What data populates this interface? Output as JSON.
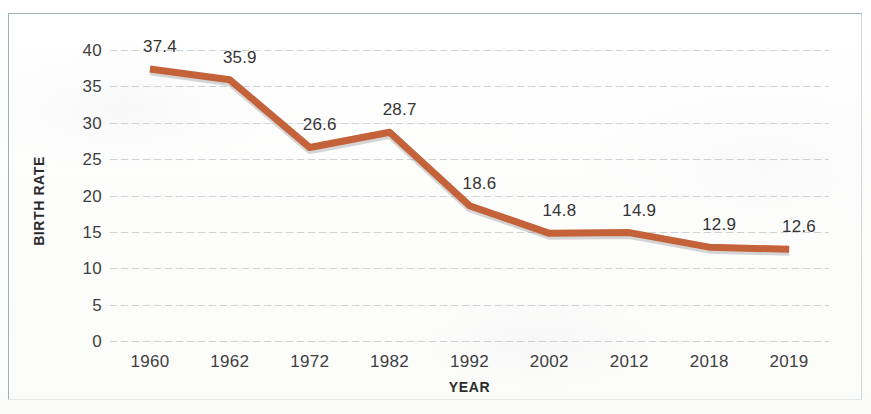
{
  "chart_data": {
    "type": "line",
    "title": "",
    "xlabel": "YEAR",
    "ylabel": "BIRTH RATE",
    "categories": [
      "1960",
      "1962",
      "1972",
      "1982",
      "1992",
      "2002",
      "2012",
      "2018",
      "2019"
    ],
    "values": [
      37.4,
      35.9,
      26.6,
      28.7,
      18.6,
      14.8,
      14.9,
      12.9,
      12.6
    ],
    "point_labels": [
      "37.4",
      "35.9",
      "26.6",
      "28.7",
      "18.6",
      "14.8",
      "14.9",
      "12.9",
      "12.6"
    ],
    "series": [
      {
        "name": "Birth Rate",
        "values": [
          37.4,
          35.9,
          26.6,
          28.7,
          18.6,
          14.8,
          14.9,
          12.9,
          12.6
        ],
        "color": "#c4623a"
      }
    ],
    "ylim": [
      0,
      40
    ],
    "ytick_values": [
      40,
      35,
      30,
      25,
      20,
      15,
      10,
      5,
      0
    ],
    "ytick_labels": [
      "40",
      "35",
      "30",
      "25",
      "20",
      "15",
      "10",
      "5",
      "0"
    ],
    "grid": "horizontal",
    "legend": "none",
    "markers": "none",
    "line_color": "#c4623a",
    "line_width": 7,
    "gridline_color": "#a8b0b6",
    "axis_text_color": "#3f3f3f",
    "plot_background": "#ffffff",
    "frame_color": "#9fb0b8"
  }
}
